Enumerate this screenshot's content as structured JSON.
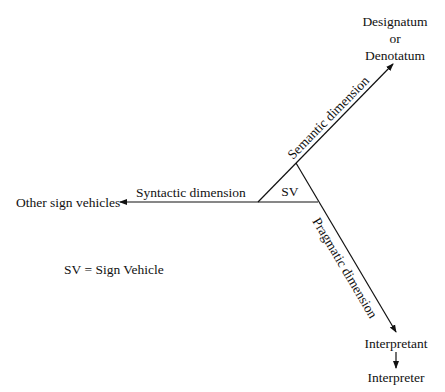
{
  "diagram": {
    "nodes": {
      "designatum": [
        "Designatum",
        "or",
        "Denotatum"
      ],
      "other_sign_vehicles": "Other sign vehicles",
      "interpretant": "Interpretant",
      "interpreter": "Interpreter",
      "center": "SV"
    },
    "edges": {
      "semantic": "Semantic dimension",
      "syntactic": "Syntactic dimension",
      "pragmatic": "Pragmatic dimension"
    },
    "legend": "SV = Sign Vehicle",
    "colors": {
      "line": "#111111",
      "background": "#ffffff"
    }
  }
}
